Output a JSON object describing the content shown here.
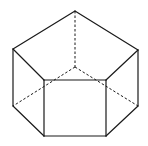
{
  "diagram": {
    "type": "pentagonal-prism",
    "vertices": {
      "top_back": [
        75,
        11
      ],
      "top_left": [
        13,
        49
      ],
      "top_right": [
        138,
        50
      ],
      "top_front_left": [
        44,
        80
      ],
      "top_front_right": [
        106,
        80
      ],
      "bottom_back": [
        75,
        67
      ],
      "bottom_left": [
        13,
        106
      ],
      "bottom_right": [
        138,
        106
      ],
      "bottom_front_left": [
        44,
        136
      ],
      "bottom_front_right": [
        106,
        136
      ]
    },
    "solid_edges": [
      [
        "top_back",
        "top_left"
      ],
      [
        "top_back",
        "top_right"
      ],
      [
        "top_left",
        "top_front_left"
      ],
      [
        "top_right",
        "top_front_right"
      ],
      [
        "top_front_left",
        "top_front_right"
      ],
      [
        "top_left",
        "bottom_left"
      ],
      [
        "top_right",
        "bottom_right"
      ],
      [
        "top_front_left",
        "bottom_front_left"
      ],
      [
        "top_front_right",
        "bottom_front_right"
      ],
      [
        "bottom_left",
        "bottom_front_left"
      ],
      [
        "bottom_right",
        "bottom_front_right"
      ],
      [
        "bottom_front_left",
        "bottom_front_right"
      ]
    ],
    "hidden_edges": [
      [
        "top_back",
        "bottom_back"
      ],
      [
        "bottom_back",
        "bottom_left"
      ],
      [
        "bottom_back",
        "bottom_right"
      ]
    ],
    "colors": {
      "line": "#1a1a1a",
      "background": "#ffffff"
    }
  }
}
